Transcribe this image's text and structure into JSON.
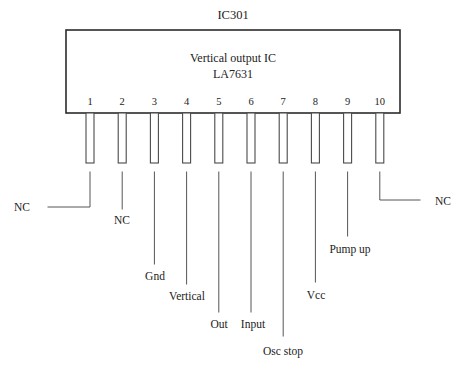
{
  "diagram": {
    "title": "IC301",
    "package": {
      "line1": "Vertical output IC",
      "line2": "LA7631"
    },
    "geometry": {
      "body_x": 66,
      "body_y": 30,
      "body_w": 334,
      "body_h": 83,
      "pin_first_cx": 90,
      "pin_spacing": 32.2,
      "pin_w": 8,
      "pin_top": 113,
      "pin_bottom": 163,
      "lead_top": 172
    },
    "pins": [
      {
        "number": "1",
        "label": "NC",
        "style": "elbow-left",
        "lead_end_y": 207,
        "elbow_x": 48,
        "label_x": 22,
        "label_y": 211,
        "label_anchor": "middle"
      },
      {
        "number": "2",
        "label": "NC",
        "style": "straight",
        "lead_end_y": 209,
        "label_x": 122,
        "label_y": 224,
        "label_anchor": "middle"
      },
      {
        "number": "3",
        "label": "Gnd",
        "style": "straight",
        "lead_end_y": 264,
        "label_x": 155,
        "label_y": 280,
        "label_anchor": "middle"
      },
      {
        "number": "4",
        "label": "Vertical",
        "style": "straight",
        "lead_end_y": 284,
        "label_x": 187,
        "label_y": 300,
        "label_anchor": "middle"
      },
      {
        "number": "5",
        "label": "Out",
        "style": "straight",
        "lead_end_y": 312,
        "label_x": 219,
        "label_y": 328,
        "label_anchor": "middle"
      },
      {
        "number": "6",
        "label": "Input",
        "style": "straight",
        "lead_end_y": 312,
        "label_x": 253,
        "label_y": 328,
        "label_anchor": "middle"
      },
      {
        "number": "7",
        "label": "Osc stop",
        "style": "straight",
        "lead_end_y": 336,
        "label_x": 283,
        "label_y": 355,
        "label_anchor": "middle"
      },
      {
        "number": "8",
        "label": "Vcc",
        "style": "straight",
        "lead_end_y": 282,
        "label_x": 316,
        "label_y": 299,
        "label_anchor": "middle"
      },
      {
        "number": "9",
        "label": "Pump up",
        "style": "straight",
        "lead_end_y": 236,
        "label_x": 350,
        "label_y": 253,
        "label_anchor": "middle"
      },
      {
        "number": "10",
        "label": "NC",
        "style": "elbow-right",
        "lead_end_y": 200,
        "elbow_x": 420,
        "label_x": 443,
        "label_y": 205,
        "label_anchor": "middle"
      }
    ],
    "colors": {
      "background": "#ffffff",
      "body_stroke": "#2b2b2b",
      "pin_stroke": "#4a4a4a",
      "lead_stroke": "#555555",
      "text": "#222222"
    }
  }
}
